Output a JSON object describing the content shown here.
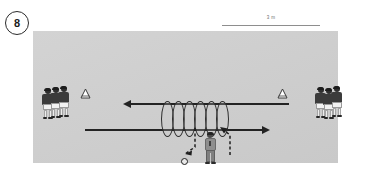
{
  "figure": {
    "number": "8",
    "scale": {
      "label": "3 m"
    }
  },
  "pitch": {
    "color": "#d0d0d0"
  },
  "diagram": {
    "type": "soccer-training-drill",
    "rings": {
      "count": 6,
      "label": "ring"
    },
    "cones": [
      {
        "name": "cone-left",
        "x": 43,
        "y": 59
      },
      {
        "name": "cone-right",
        "x": 272,
        "y": 59
      }
    ],
    "player_groups": [
      {
        "name": "left-group",
        "count": 3,
        "label": "player"
      },
      {
        "name": "right-group",
        "count": 3,
        "label": "player"
      }
    ],
    "coach": {
      "label": "coach"
    },
    "ball": {
      "label": "ball"
    },
    "arrows": [
      {
        "name": "run-arrow-left",
        "direction": "left"
      },
      {
        "name": "run-arrow-right",
        "direction": "right"
      },
      {
        "name": "pass-arrow-in",
        "direction": "down-left",
        "style": "dashed"
      },
      {
        "name": "pass-arrow-out",
        "direction": "up-left",
        "style": "dashed"
      }
    ]
  }
}
